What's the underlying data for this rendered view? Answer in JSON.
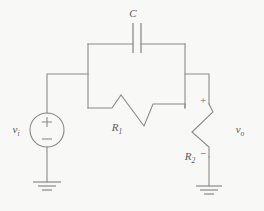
{
  "diagram": {
    "background_color": "#f8f8f6",
    "line_color": "#8a8a8a",
    "text_color": "#5a5a5a"
  },
  "components": {
    "source": {
      "name": "voltage-source",
      "label": "v",
      "label_sub": "i",
      "plus_sign": "+",
      "minus_sign": "−",
      "type": "independent-voltage-source"
    },
    "capacitor": {
      "name": "capacitor",
      "label": "C",
      "label_sub": "",
      "type": "capacitor"
    },
    "resistor1": {
      "name": "resistor-r1",
      "label": "R",
      "label_sub": "1",
      "type": "resistor",
      "orientation": "horizontal"
    },
    "resistor2": {
      "name": "resistor-r2",
      "label": "R",
      "label_sub": "2",
      "type": "resistor",
      "orientation": "vertical"
    },
    "output": {
      "name": "output-voltage",
      "label": "v",
      "label_sub": "o",
      "plus_sign": "+",
      "minus_sign": "−"
    },
    "ground_left": {
      "name": "ground-left",
      "type": "ground"
    },
    "ground_right": {
      "name": "ground-right",
      "type": "ground"
    }
  }
}
